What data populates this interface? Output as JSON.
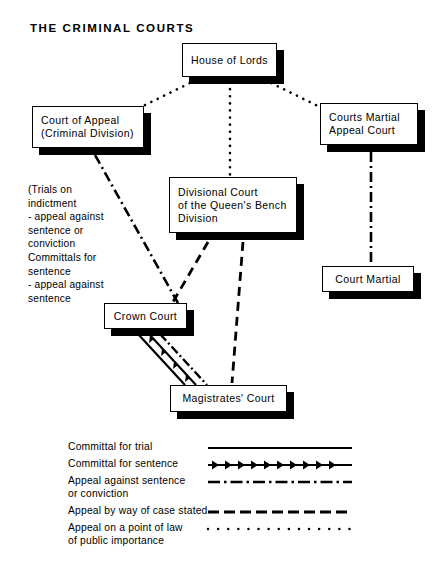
{
  "title": "THE CRIMINAL COURTS",
  "nodes": [
    {
      "id": "house-of-lords",
      "label": "House of Lords"
    },
    {
      "id": "court-of-appeal",
      "label": "Court of Appeal\n(Criminal Division)"
    },
    {
      "id": "courts-martial-appeal",
      "label": "Courts Martial\nAppeal Court"
    },
    {
      "id": "divisional-court",
      "label": "Divisional Court\nof the Queen's Bench\nDivision"
    },
    {
      "id": "court-martial",
      "label": "Court Martial"
    },
    {
      "id": "crown-court",
      "label": "Crown Court"
    },
    {
      "id": "magistrates-court",
      "label": "Magistrates' Court"
    }
  ],
  "annotation": "(Trials on\n  indictment\n   - appeal against\n     sentence or\n     conviction\nCommittals for\n  sentence\n   - appeal against\n     sentence",
  "legend": {
    "items": [
      {
        "label": "Committal for trial",
        "style": "solid"
      },
      {
        "label": "Committal for sentence",
        "style": "arrows"
      },
      {
        "label": "Appeal against sentence\n   or conviction",
        "style": "dash-dot"
      },
      {
        "label": "Appeal by way of case stated",
        "style": "dashed"
      },
      {
        "label": "Appeal on a point of law\n   of public importance",
        "style": "dotted"
      }
    ]
  },
  "colors": {
    "ink": "#000000",
    "paper": "#ffffff"
  }
}
